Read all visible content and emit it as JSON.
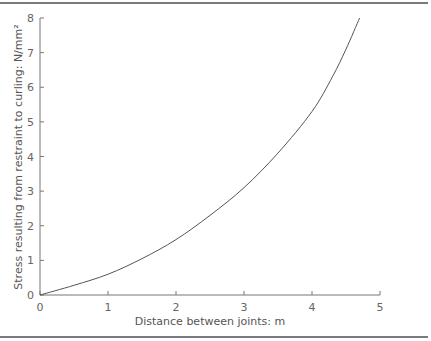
{
  "chart_data": {
    "type": "line",
    "title": "",
    "xlabel": "Distance between joints: m",
    "ylabel": "Stress resulting from restraint to curling: N/mm²",
    "xlim": [
      0,
      5
    ],
    "ylim": [
      0,
      8
    ],
    "x_ticks": [
      "0",
      "1",
      "2",
      "3",
      "4",
      "5"
    ],
    "y_ticks": [
      "0",
      "1",
      "2",
      "3",
      "4",
      "5",
      "6",
      "7",
      "8"
    ],
    "grid": false,
    "legend": null,
    "series": [
      {
        "name": "Curling stress",
        "x": [
          0,
          0.5,
          1,
          1.5,
          2,
          2.5,
          3,
          3.5,
          4,
          4.3,
          4.5,
          4.7
        ],
        "y": [
          0,
          0.28,
          0.6,
          1.05,
          1.6,
          2.3,
          3.1,
          4.1,
          5.3,
          6.3,
          7.1,
          8.0
        ]
      }
    ]
  }
}
